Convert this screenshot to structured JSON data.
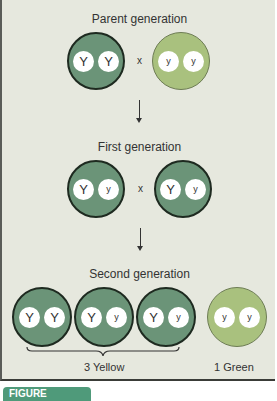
{
  "diagram": {
    "colors": {
      "yellow_seed": "#6b9478",
      "green_seed": "#a9c17e",
      "background": "#e6e8de",
      "figure_tab": "#4f9a7a"
    },
    "parent_generation": {
      "label": "Parent generation",
      "cross_symbol": "x",
      "individuals": [
        {
          "phenotype": "yellow",
          "alleles": [
            "Y",
            "Y"
          ]
        },
        {
          "phenotype": "green",
          "alleles": [
            "y",
            "y"
          ]
        }
      ]
    },
    "first_generation": {
      "label": "First generation",
      "cross_symbol": "x",
      "individuals": [
        {
          "phenotype": "yellow",
          "alleles": [
            "Y",
            "y"
          ]
        },
        {
          "phenotype": "yellow",
          "alleles": [
            "Y",
            "y"
          ]
        }
      ]
    },
    "second_generation": {
      "label": "Second generation",
      "individuals": [
        {
          "phenotype": "yellow",
          "alleles": [
            "Y",
            "Y"
          ]
        },
        {
          "phenotype": "yellow",
          "alleles": [
            "Y",
            "y"
          ]
        },
        {
          "phenotype": "yellow",
          "alleles": [
            "Y",
            "y"
          ]
        },
        {
          "phenotype": "green",
          "alleles": [
            "y",
            "y"
          ]
        }
      ],
      "yellow_count_label": "3 Yellow",
      "green_count_label": "1 Green"
    },
    "figure_tab_label": "FIGURE"
  }
}
